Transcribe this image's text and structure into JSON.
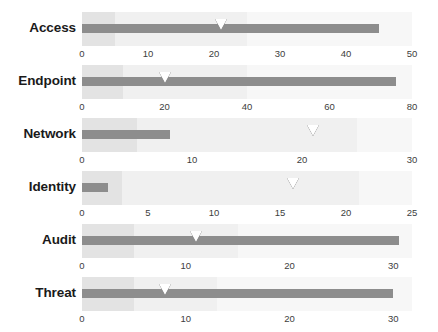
{
  "chart_data": {
    "type": "bar",
    "chart_style": "bullet",
    "title": "",
    "xlabel": "",
    "ylabel": "",
    "grid": false,
    "legend": false,
    "categories": [
      "Access",
      "Endpoint",
      "Network",
      "Identity",
      "Audit",
      "Threat"
    ],
    "series": [
      {
        "name": "measure",
        "values": [
          45,
          76,
          8,
          2,
          30.5,
          30
        ]
      },
      {
        "name": "target",
        "values": [
          21,
          20,
          21,
          16,
          11,
          8
        ]
      }
    ],
    "rows": [
      {
        "label": "Access",
        "measure": 45,
        "target": 21,
        "axis_min": 0,
        "axis_max": 50,
        "ticks": [
          0,
          10,
          20,
          30,
          40,
          50
        ],
        "bands": [
          5,
          25,
          50
        ]
      },
      {
        "label": "Endpoint",
        "measure": 76,
        "target": 20,
        "axis_min": 0,
        "axis_max": 80,
        "ticks": [
          0,
          20,
          40,
          60,
          80
        ],
        "bands": [
          10,
          40,
          80
        ]
      },
      {
        "label": "Network",
        "measure": 8,
        "target": 21,
        "axis_min": 0,
        "axis_max": 30,
        "ticks": [
          0,
          10,
          20,
          30
        ],
        "bands": [
          5,
          25,
          30
        ]
      },
      {
        "label": "Identity",
        "measure": 2,
        "target": 16,
        "axis_min": 0,
        "axis_max": 25,
        "ticks": [
          0,
          5,
          10,
          15,
          20,
          25
        ],
        "bands": [
          3,
          21,
          25
        ]
      },
      {
        "label": "Audit",
        "measure": 30.5,
        "target": 11,
        "axis_min": 0,
        "axis_max": 31.8,
        "ticks": [
          0,
          10,
          20,
          30
        ],
        "bands": [
          5,
          15,
          31.8
        ]
      },
      {
        "label": "Threat",
        "measure": 30,
        "target": 8,
        "axis_min": 0,
        "axis_max": 31.8,
        "ticks": [
          0,
          10,
          20,
          30
        ],
        "bands": [
          5,
          13,
          31.8
        ]
      }
    ],
    "colors": {
      "measure": "#8d8d8d",
      "band_low": "#e3e3e3",
      "band_mid": "#f0f0f0",
      "band_high": "#f7f7f7",
      "marker": "#ffffff",
      "marker_outline": "#1b1b1b",
      "label": "#1a1a1a",
      "tick": "#3d3d3d",
      "background": "#ffffff"
    },
    "layout": {
      "track_left_px": 82,
      "track_width_px": 330,
      "row_height_px": 53,
      "first_row_top_px": 12
    }
  }
}
